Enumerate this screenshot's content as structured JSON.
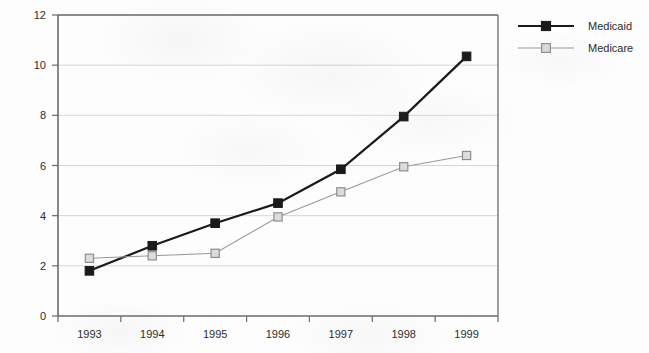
{
  "chart_data": {
    "type": "line",
    "title": "",
    "subtitle": "",
    "xlabel": "",
    "ylabel": "",
    "categories": [
      "1993",
      "1994",
      "1995",
      "1996",
      "1997",
      "1998",
      "1999"
    ],
    "ylim": [
      0,
      12
    ],
    "yticks": [
      0,
      2,
      4,
      6,
      8,
      10,
      12
    ],
    "ytick_labels": [
      "0",
      "2",
      "4",
      "6",
      "8",
      "10",
      "12"
    ],
    "grid": "horizontal",
    "legend_position": "right",
    "series": [
      {
        "name": "Medicaid",
        "values": [
          1.8,
          2.8,
          3.7,
          4.5,
          5.85,
          7.95,
          10.35
        ],
        "color": "#1a1a1a",
        "marker": "filled-square",
        "line_width": 2.2
      },
      {
        "name": "Medicare",
        "values": [
          2.3,
          2.4,
          2.5,
          3.95,
          4.95,
          5.95,
          6.4
        ],
        "color": "#9a9a9a",
        "marker": "open-square",
        "marker_fill": "#dcdcdc",
        "line_width": 1.1
      }
    ]
  },
  "axes": {
    "axis_color": "#6b6b6b",
    "grid_color": "#d6d6d6",
    "background": "#fdfdfd"
  },
  "legend": {
    "entries": [
      {
        "label": "Medicaid"
      },
      {
        "label": "Medicare"
      }
    ]
  }
}
